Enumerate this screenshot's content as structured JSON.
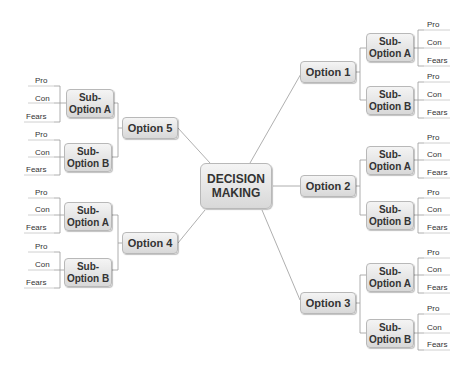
{
  "root": {
    "label_line1": "DECISION",
    "label_line2": "MAKING"
  },
  "options": [
    {
      "label": "Option 1",
      "side": "right",
      "subs": [
        {
          "line1": "Sub-",
          "line2": "Option A",
          "leaves": [
            "Pro",
            "Con",
            "Fears"
          ]
        },
        {
          "line1": "Sub-",
          "line2": "Option B",
          "leaves": [
            "Pro",
            "Con",
            "Fears"
          ]
        }
      ]
    },
    {
      "label": "Option 2",
      "side": "right",
      "subs": [
        {
          "line1": "Sub-",
          "line2": "Option A",
          "leaves": [
            "Pro",
            "Con",
            "Fears"
          ]
        },
        {
          "line1": "Sub-",
          "line2": "Option B",
          "leaves": [
            "Pro",
            "Con",
            "Fears"
          ]
        }
      ]
    },
    {
      "label": "Option 3",
      "side": "right",
      "subs": [
        {
          "line1": "Sub-",
          "line2": "Option A",
          "leaves": [
            "Pro",
            "Con",
            "Fears"
          ]
        },
        {
          "line1": "Sub-",
          "line2": "Option B",
          "leaves": [
            "Pro",
            "Con",
            "Fears"
          ]
        }
      ]
    },
    {
      "label": "Option 4",
      "side": "left",
      "subs": [
        {
          "line1": "Sub-",
          "line2": "Option A",
          "leaves": [
            "Pro",
            "Con",
            "Fears"
          ]
        },
        {
          "line1": "Sub-",
          "line2": "Option B",
          "leaves": [
            "Pro",
            "Con",
            "Fears"
          ]
        }
      ]
    },
    {
      "label": "Option 5",
      "side": "left",
      "subs": [
        {
          "line1": "Sub-",
          "line2": "Option A",
          "leaves": [
            "Pro",
            "Con",
            "Fears"
          ]
        },
        {
          "line1": "Sub-",
          "line2": "Option B",
          "leaves": [
            "Pro",
            "Con",
            "Fears"
          ]
        }
      ]
    }
  ],
  "colors": {
    "line": "#9a9a9a",
    "node_top": "#f4f4f4",
    "node_bottom": "#d8d8d8",
    "node_border": "#b8b8b8"
  }
}
